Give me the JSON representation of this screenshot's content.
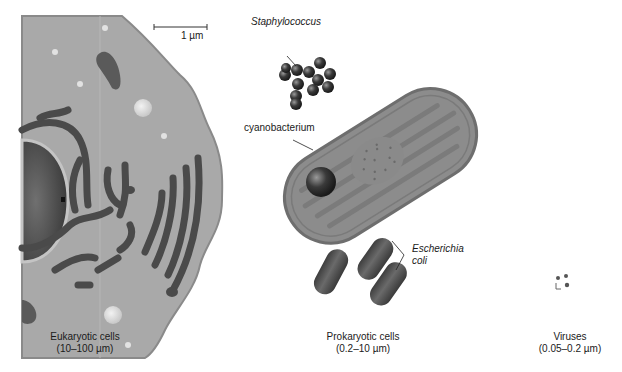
{
  "scale_bar": {
    "label": "1 µm"
  },
  "labels": {
    "staphylococcus": "Staphylococcus",
    "cyanobacterium": "cyanobacterium",
    "escherichia_line1": "Escherichia",
    "escherichia_line2": "coli"
  },
  "captions": {
    "eukaryotic": {
      "title": "Eukaryotic cells",
      "range": "(10–100 µm)"
    },
    "prokaryotic": {
      "title": "Prokaryotic cells",
      "range": "(0.2–10 µm)"
    },
    "viruses": {
      "title": "Viruses",
      "range": "(0.05–0.2 µm)"
    }
  },
  "colors": {
    "cytoplasm": "#a9a9a9",
    "membrane": "#8a8a8a",
    "organelle_dark": "#4a4a4a",
    "cyano_body": "#8c8c8c",
    "cyano_membrane": "#6e6e6e",
    "bacteria": "#5a5a5a"
  }
}
